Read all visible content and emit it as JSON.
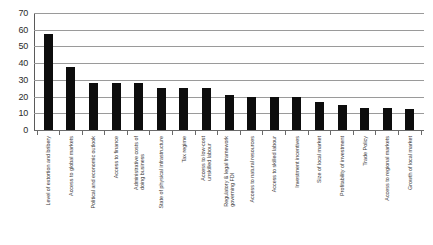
{
  "chart_data": {
    "type": "bar",
    "title": "",
    "xlabel": "",
    "ylabel": "",
    "ylim": [
      0,
      70
    ],
    "ytick_step": 10,
    "yticks": [
      "0",
      "10",
      "20",
      "30",
      "40",
      "50",
      "60",
      "70"
    ],
    "grid": true,
    "legend": "none",
    "bar_color": "#0d0d0d",
    "grid_color": "#9a9a9a",
    "categories": [
      "Level of extortion and bribery",
      "Access to global markets",
      "Political and economic outlook",
      "Access to finance",
      "Administrative costs of doing business",
      "State of physical infrastructure",
      "Tax regime",
      "Access to low-cost unskilled labour",
      "Regulatory & legal framework governing FDI",
      "Access to natural resources",
      "Access to skilled labour",
      "Investment incentives",
      "Size of local market",
      "Profitability of investment",
      "Trade Policy",
      "Access to regional markets",
      "Growth of local market"
    ],
    "category_lines": [
      [
        "Level of extortion and bribery",
        ""
      ],
      [
        "Access to global markets",
        ""
      ],
      [
        "Political and economic outlook",
        ""
      ],
      [
        "Access to finance",
        ""
      ],
      [
        "Administrative costs of",
        "doing business"
      ],
      [
        "State of physical infrastructure",
        ""
      ],
      [
        "Tax regime",
        ""
      ],
      [
        "Access to low-cost",
        "unskilled labour"
      ],
      [
        "Regulatory & legal framework",
        "governing FDI"
      ],
      [
        "Access to natural resources",
        ""
      ],
      [
        "Access to skilled labour",
        ""
      ],
      [
        "Investment incentives",
        ""
      ],
      [
        "Size of local market",
        ""
      ],
      [
        "Profitability of investment",
        ""
      ],
      [
        "Trade Policy",
        ""
      ],
      [
        "Access to regional markets",
        ""
      ],
      [
        "Growth of local market",
        ""
      ]
    ],
    "values": [
      57.5,
      37.5,
      28,
      28,
      28,
      25,
      25,
      25,
      21,
      20,
      20,
      20,
      17,
      15,
      13,
      13,
      12.5
    ]
  }
}
